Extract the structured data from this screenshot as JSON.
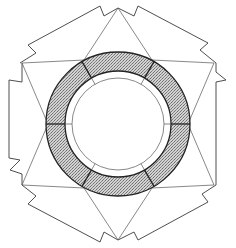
{
  "figure": {
    "description": "Line drawing of a hexagonal ring structure: stippled annular ring split into six segments, surrounded by triangular facets and zig-zag outer edges",
    "width": 236,
    "height": 248,
    "colors": {
      "background": "#ffffff",
      "line": "#3a3a3a",
      "stipple": "#7a7a7a"
    },
    "center": [
      118,
      124
    ],
    "ring": {
      "outer_radius": 72,
      "inner_radius": 53,
      "innermost_radius": 46,
      "segments": 6
    },
    "hex_vertices": [
      [
        118,
        8
      ],
      [
        216,
        63
      ],
      [
        216,
        185
      ],
      [
        118,
        240
      ],
      [
        20,
        185
      ],
      [
        20,
        63
      ]
    ]
  }
}
